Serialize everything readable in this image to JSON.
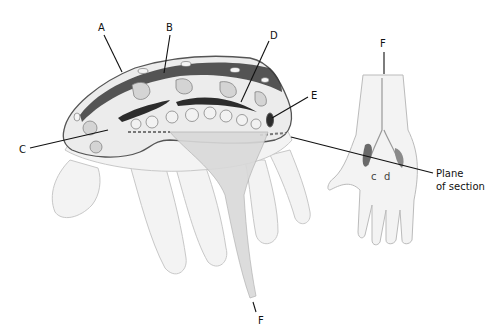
{
  "figure": {
    "type": "anatomical-diagram",
    "colors": {
      "outline": "#555555",
      "skin": "#ececec",
      "tissue": "#dcdcdc",
      "dark_band": "#3a3a3a",
      "tendon": "#cfcfcf",
      "label": "#111111"
    }
  },
  "labels": {
    "A": "A",
    "B": "B",
    "C": "C",
    "D": "D",
    "E": "E",
    "F_top": "F",
    "F_bottom": "F",
    "plane_line1": "Plane",
    "plane_line2": "of section"
  },
  "views": [
    {
      "name": "cross-section-view",
      "description": "Cross-section through palm with tendons fanning to fingers"
    },
    {
      "name": "palm-view",
      "description": "Small palmar view of hand indicating plane of section"
    }
  ]
}
